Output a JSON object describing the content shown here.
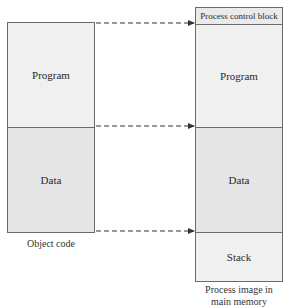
{
  "left_block": {
    "caption": "Object code",
    "segments": [
      {
        "label": "Program"
      },
      {
        "label": "Data"
      }
    ]
  },
  "right_block": {
    "caption_line1": "Process image in",
    "caption_line2": "main memory",
    "segments": [
      {
        "label": "Process control block"
      },
      {
        "label": "Program"
      },
      {
        "label": "Data"
      },
      {
        "label": "Stack"
      }
    ]
  },
  "arrows": [
    {
      "from": "object-code-top",
      "to": "pcb-bottom",
      "style": "dashed"
    },
    {
      "from": "program-data-boundary",
      "to": "program-data-boundary",
      "style": "dashed"
    },
    {
      "from": "object-code-bottom",
      "to": "data-stack-boundary",
      "style": "dashed"
    }
  ],
  "colors": {
    "border": "#6a6a6a",
    "fill_light": "#f0f0f0",
    "fill_dark": "#e6e6e6",
    "arrow": "#333333"
  }
}
